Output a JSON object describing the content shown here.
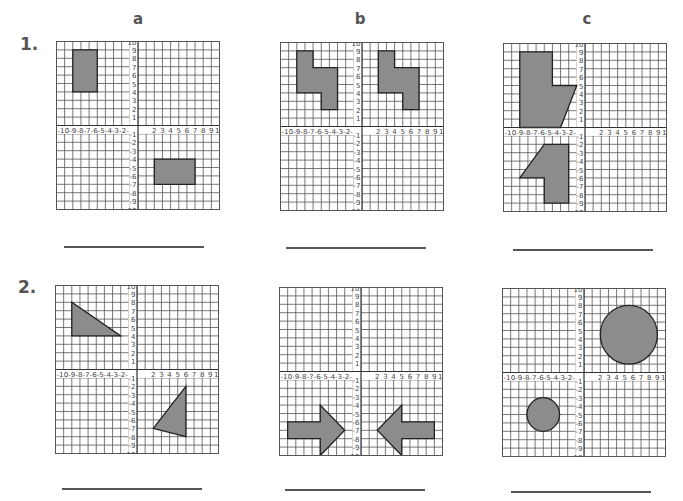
{
  "worksheet": {
    "columns": [
      {
        "label": "a",
        "x": 123
      },
      {
        "label": "b",
        "x": 345
      },
      {
        "label": "c",
        "x": 572
      }
    ],
    "rows": [
      {
        "label": "1.",
        "x": 20,
        "y": 34
      },
      {
        "label": "2.",
        "x": 18,
        "y": 277
      }
    ],
    "grid": {
      "min": -10,
      "max": 10,
      "x_tick_labels_neg": "-10-9-8-7-6-5-4-3-2-",
      "x_tick_labels_pos": [
        "2",
        "3",
        "4",
        "5",
        "6",
        "7",
        "8",
        "9",
        "10"
      ],
      "y_tick_labels": [
        "10",
        "9",
        "8",
        "7",
        "6",
        "5",
        "4",
        "3",
        "2",
        "1",
        "-1",
        "-2",
        "-3",
        "-4",
        "-5",
        "-6",
        "-7",
        "-8",
        "-9",
        "-10"
      ],
      "line_color": "#555555",
      "axis_color": "#333333",
      "shape_fill": "#8c8c8c",
      "shape_stroke": "#222222"
    },
    "problems": [
      {
        "id": "1a",
        "left": 56,
        "top": 41,
        "width": 163,
        "height": 168,
        "shapes": [
          {
            "type": "polygon",
            "points": [
              [
                -8,
                9
              ],
              [
                -5,
                9
              ],
              [
                -5,
                4
              ],
              [
                -8,
                4
              ]
            ]
          },
          {
            "type": "polygon",
            "points": [
              [
                2,
                -4
              ],
              [
                7,
                -4
              ],
              [
                7,
                -7
              ],
              [
                2,
                -7
              ]
            ]
          }
        ]
      },
      {
        "id": "1b",
        "left": 280,
        "top": 42,
        "width": 163,
        "height": 168,
        "shapes": [
          {
            "type": "polygon",
            "points": [
              [
                -8,
                9
              ],
              [
                -6,
                9
              ],
              [
                -6,
                7
              ],
              [
                -3,
                7
              ],
              [
                -3,
                2
              ],
              [
                -5,
                2
              ],
              [
                -5,
                4
              ],
              [
                -8,
                4
              ]
            ]
          },
          {
            "type": "polygon",
            "points": [
              [
                2,
                9
              ],
              [
                4,
                9
              ],
              [
                4,
                7
              ],
              [
                7,
                7
              ],
              [
                7,
                2
              ],
              [
                5,
                2
              ],
              [
                5,
                4
              ],
              [
                2,
                4
              ]
            ]
          }
        ]
      },
      {
        "id": "1c",
        "left": 503,
        "top": 43,
        "width": 163,
        "height": 168,
        "shapes": [
          {
            "type": "polygon",
            "points": [
              [
                -8,
                9
              ],
              [
                -4,
                9
              ],
              [
                -4,
                5
              ],
              [
                -1,
                5
              ],
              [
                -3,
                0
              ],
              [
                -8,
                0
              ]
            ]
          },
          {
            "type": "polygon",
            "points": [
              [
                -5,
                -2
              ],
              [
                -2,
                -2
              ],
              [
                -2,
                -9
              ],
              [
                -5,
                -9
              ],
              [
                -5,
                -6
              ],
              [
                -8,
                -6
              ]
            ]
          }
        ]
      },
      {
        "id": "2a",
        "left": 55,
        "top": 285,
        "width": 163,
        "height": 168,
        "shapes": [
          {
            "type": "polygon",
            "points": [
              [
                -8,
                8
              ],
              [
                -8,
                4
              ],
              [
                -2,
                4
              ]
            ]
          },
          {
            "type": "polygon",
            "points": [
              [
                6,
                -2
              ],
              [
                6,
                -8
              ],
              [
                2,
                -7
              ]
            ]
          }
        ]
      },
      {
        "id": "2b",
        "left": 279,
        "top": 287,
        "width": 163,
        "height": 168,
        "shapes": [
          {
            "type": "polygon",
            "points": [
              [
                -9,
                -6
              ],
              [
                -5,
                -6
              ],
              [
                -5,
                -4
              ],
              [
                -2,
                -7
              ],
              [
                -5,
                -10
              ],
              [
                -5,
                -8
              ],
              [
                -9,
                -8
              ]
            ]
          },
          {
            "type": "polygon",
            "points": [
              [
                9,
                -6
              ],
              [
                5,
                -6
              ],
              [
                5,
                -4
              ],
              [
                2,
                -7
              ],
              [
                5,
                -10
              ],
              [
                5,
                -8
              ],
              [
                9,
                -8
              ]
            ]
          }
        ]
      },
      {
        "id": "2c",
        "left": 502,
        "top": 288,
        "width": 163,
        "height": 168,
        "shapes": [
          {
            "type": "circle",
            "cx": 5.5,
            "cy": 4.5,
            "r": 3.5
          },
          {
            "type": "circle",
            "cx": -5,
            "cy": -5,
            "r": 2
          }
        ]
      }
    ],
    "answer_lines": [
      {
        "x1": 64,
        "x2": 204,
        "y": 246
      },
      {
        "x1": 286,
        "x2": 426,
        "y": 247
      },
      {
        "x1": 513,
        "x2": 653,
        "y": 249
      },
      {
        "x1": 62,
        "x2": 202,
        "y": 488
      },
      {
        "x1": 285,
        "x2": 425,
        "y": 489
      },
      {
        "x1": 511,
        "x2": 651,
        "y": 491
      }
    ]
  }
}
